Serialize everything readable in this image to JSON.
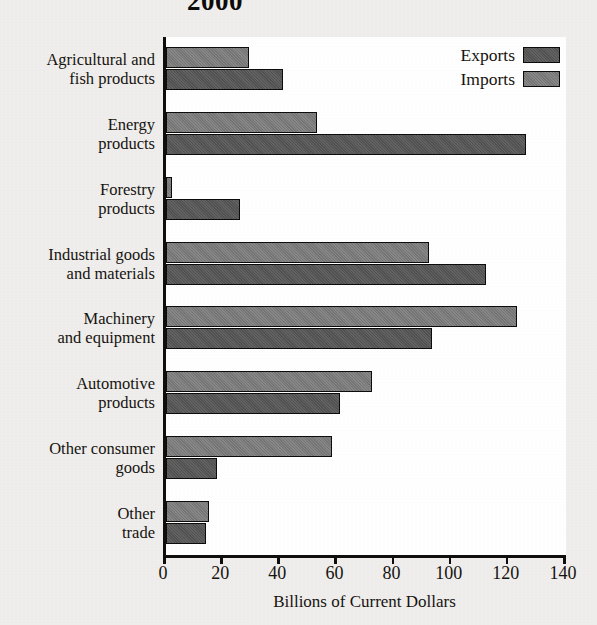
{
  "title": "2000",
  "legend": {
    "position": "top-right",
    "entries": [
      {
        "label": "Exports",
        "color": "#575757"
      },
      {
        "label": "Imports",
        "color": "#7b7b7b"
      }
    ]
  },
  "axis": {
    "x_title": "Billions of Current Dollars",
    "ticks": [
      "0",
      "20",
      "40",
      "60",
      "80",
      "100",
      "120",
      "140"
    ]
  },
  "chart_data": {
    "type": "bar",
    "orientation": "horizontal",
    "grouped": true,
    "title": "2000",
    "xlabel": "Billions of Current Dollars",
    "ylabel": "",
    "xlim": [
      0,
      140
    ],
    "xticks": [
      0,
      20,
      40,
      60,
      80,
      100,
      120,
      140
    ],
    "grid": false,
    "legend_position": "top-right",
    "categories": [
      "Agricultural and fish products",
      "Energy products",
      "Forestry products",
      "Industrial goods and materials",
      "Machinery and equipment",
      "Automotive products",
      "Other consumer goods",
      "Other trade"
    ],
    "category_lines": [
      [
        "Agricultural and",
        "fish products"
      ],
      [
        "Energy",
        "products"
      ],
      [
        "Forestry",
        "products"
      ],
      [
        "Industrial goods",
        "and materials"
      ],
      [
        "Machinery",
        "and equipment"
      ],
      [
        "Automotive",
        "products"
      ],
      [
        "Other consumer",
        "goods"
      ],
      [
        "Other",
        "trade"
      ]
    ],
    "series": [
      {
        "name": "Imports",
        "color": "#7b7b7b",
        "values": [
          29,
          53,
          2,
          92,
          123,
          72,
          58,
          15
        ]
      },
      {
        "name": "Exports",
        "color": "#575757",
        "values": [
          41,
          126,
          26,
          112,
          93,
          61,
          18,
          14
        ]
      }
    ]
  }
}
